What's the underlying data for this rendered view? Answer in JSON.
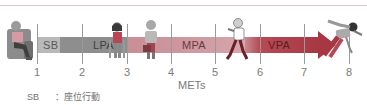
{
  "diagram": {
    "type": "intensity-scale",
    "axis": {
      "title": "METs",
      "ticks": [
        "1",
        "2",
        "3",
        "4",
        "5",
        "6",
        "7",
        "8"
      ]
    },
    "segments": [
      {
        "label": "SB",
        "from": 1,
        "to": 1.5,
        "color": "#b9b9b9"
      },
      {
        "label": "LPA",
        "from": 1.5,
        "to": 3,
        "color": "#8e8e8e"
      },
      {
        "label": "MPA",
        "from": 3,
        "to": 5.6,
        "color": "#cf9aa1"
      },
      {
        "label": "VPA",
        "from": 5.6,
        "to": 7.5,
        "color": "#a73843"
      }
    ],
    "figures": [
      {
        "name": "sitting-person",
        "position": "before 1"
      },
      {
        "name": "standing-person",
        "position": "near 3"
      },
      {
        "name": "person-carrying-bag",
        "position": "between 3 and 4"
      },
      {
        "name": "walking-person",
        "position": "between 5 and 6"
      },
      {
        "name": "sprinting-runner",
        "position": "near 8"
      }
    ],
    "legend": {
      "abbr": "SB",
      "separator": "：",
      "meaning": "座位行動"
    }
  }
}
